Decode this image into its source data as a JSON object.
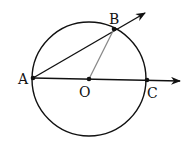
{
  "diagram": {
    "title": "",
    "points": {
      "A": {
        "label": "A",
        "x": 33,
        "y": 78
      },
      "B": {
        "label": "B",
        "x": 114,
        "y": 29
      },
      "O": {
        "label": "O",
        "x": 89,
        "y": 79
      },
      "C": {
        "label": "C",
        "x": 147,
        "y": 80
      }
    },
    "circle": {
      "center": "O",
      "radius": 57
    },
    "rays": [
      {
        "from": "A",
        "through": "B",
        "label": "ray AB"
      },
      {
        "from": "A",
        "through": "C",
        "label": "ray AC"
      }
    ],
    "segments": [
      {
        "from": "O",
        "to": "B",
        "color": "#888888"
      }
    ],
    "colors": {
      "stroke": "#111111",
      "radius": "#888888"
    }
  }
}
